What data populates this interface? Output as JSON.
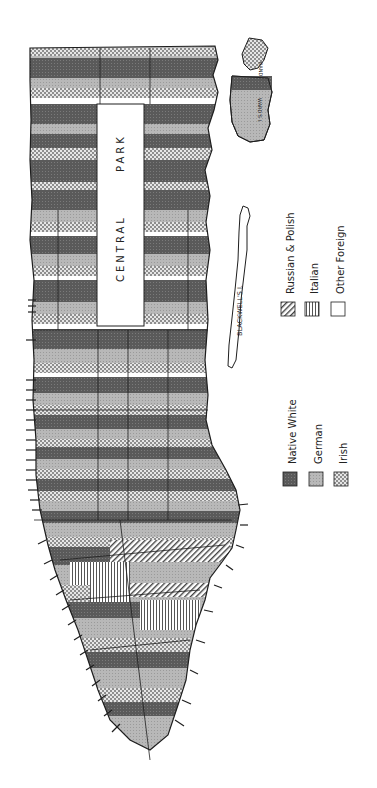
{
  "map": {
    "subject": "Manhattan ethnic distribution map (rotated)",
    "orientation": "rotated 90° counter-clockwise; north at top",
    "labels": {
      "central_park_1": "CENTRAL",
      "central_park_2": "PARK",
      "blackwells": "BLACKWELL'S I.",
      "randalls": "RAND'S I.",
      "wards": "WARD'S I."
    }
  },
  "legend": {
    "items": [
      {
        "label": "Native White",
        "pattern": "dark-crosshatch",
        "color": "#5c5c5c"
      },
      {
        "label": "German",
        "pattern": "light-stipple",
        "color": "#b4b4b4"
      },
      {
        "label": "Irish",
        "pattern": "checker",
        "color": "#d6d6d6"
      },
      {
        "label": "Russian & Polish",
        "pattern": "diagonal-hatch",
        "color": "#a0a0a0"
      },
      {
        "label": "Italian",
        "pattern": "vertical-lines",
        "color": "#9a9a9a"
      },
      {
        "label": "Other Foreign",
        "pattern": "blank",
        "color": "#ffffff"
      }
    ]
  },
  "colors": {
    "outline": "#1e1e1e",
    "background": "#ffffff"
  }
}
